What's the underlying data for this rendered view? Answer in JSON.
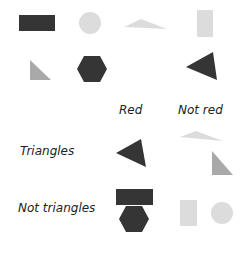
{
  "colors": {
    "dark": "#353535",
    "light": "#dcdcdc",
    "gray": "#a9a9a9",
    "text": "#222222"
  },
  "shapes_pool": [
    {
      "shape": "rectangle",
      "tone": "dark"
    },
    {
      "shape": "circle",
      "tone": "light"
    },
    {
      "shape": "triangle",
      "tone": "light"
    },
    {
      "shape": "rectangle",
      "tone": "light"
    },
    {
      "shape": "triangle",
      "tone": "gray"
    },
    {
      "shape": "hexagon",
      "tone": "dark"
    },
    {
      "shape": "triangle",
      "tone": "dark"
    }
  ],
  "table": {
    "column_headers": [
      "Red",
      "Not red"
    ],
    "row_headers": [
      "Triangles",
      "Not triangles"
    ],
    "cells": {
      "triangles_red": [
        {
          "shape": "triangle",
          "tone": "dark"
        }
      ],
      "triangles_not_red": [
        {
          "shape": "triangle",
          "tone": "light"
        },
        {
          "shape": "triangle",
          "tone": "gray"
        }
      ],
      "not_triangles_red": [
        {
          "shape": "rectangle",
          "tone": "dark"
        },
        {
          "shape": "hexagon",
          "tone": "dark"
        }
      ],
      "not_triangles_not_red": [
        {
          "shape": "rectangle",
          "tone": "light"
        },
        {
          "shape": "circle",
          "tone": "light"
        }
      ]
    }
  }
}
